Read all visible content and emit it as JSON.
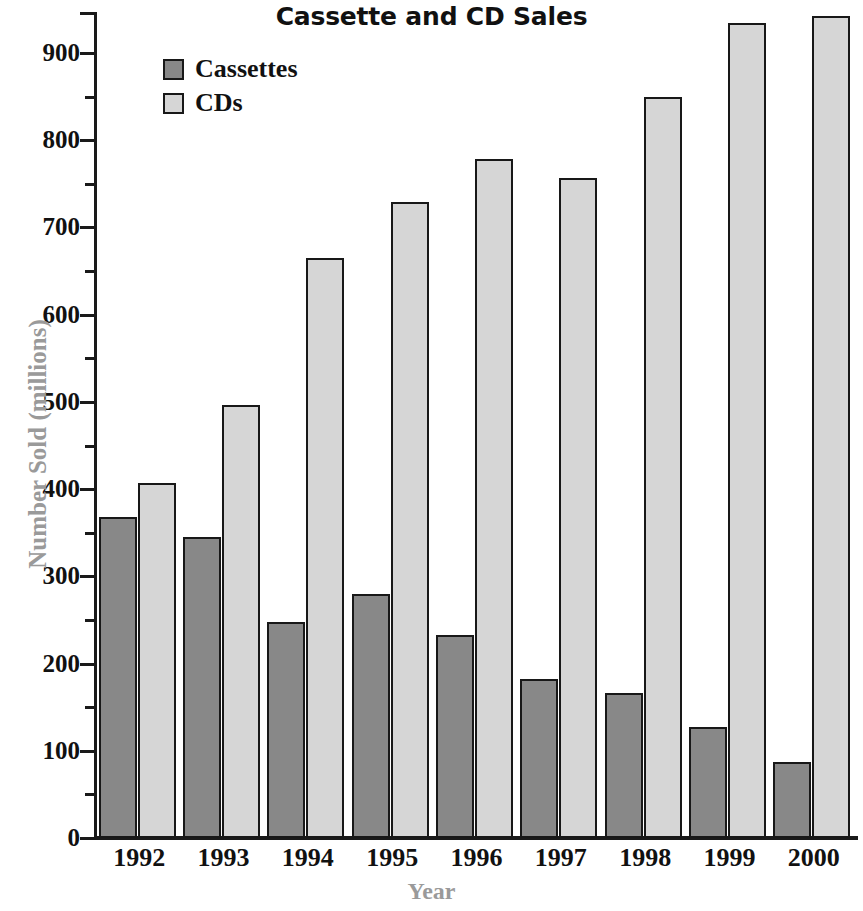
{
  "chart_data": {
    "type": "bar",
    "title": "Cassette and CD Sales",
    "xlabel": "Year",
    "ylabel": "Number Sold (millions)",
    "categories": [
      "1992",
      "1993",
      "1994",
      "1995",
      "1996",
      "1997",
      "1998",
      "1999",
      "2000"
    ],
    "series": [
      {
        "name": "Cassettes",
        "color": "#888888",
        "values": [
          368,
          345,
          248,
          280,
          233,
          182,
          166,
          127,
          87
        ]
      },
      {
        "name": "CDs",
        "color": "#d6d6d6",
        "values": [
          407,
          497,
          665,
          729,
          778,
          757,
          849,
          934,
          943
        ]
      }
    ],
    "ylim": [
      0,
      950
    ],
    "ytick_labels": [
      "0",
      "100",
      "200",
      "300",
      "400",
      "500",
      "600",
      "700",
      "800",
      "900"
    ],
    "ytick_values": [
      0,
      100,
      200,
      300,
      400,
      500,
      600,
      700,
      800,
      900
    ],
    "yminor_values": [
      50,
      150,
      250,
      350,
      450,
      550,
      650,
      750,
      850,
      950
    ],
    "grid": false,
    "legend_position": "upper-left-inside",
    "legend": [
      "Cassettes",
      "CDs"
    ]
  },
  "colors": {
    "cassette": "#888888",
    "cd": "#d6d6d6",
    "axis": "#1a1a1a",
    "axis_title": "#9a9a9a",
    "text": "#111111"
  }
}
